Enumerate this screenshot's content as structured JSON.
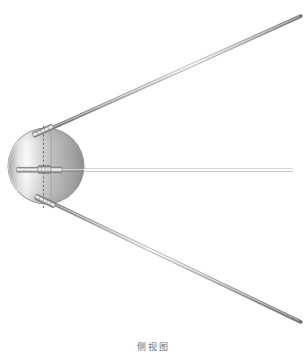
{
  "figure": {
    "caption": "侧视图",
    "caption_meaning": "side view",
    "background_color": "#ffffff",
    "canvas": {
      "width": 307,
      "height": 364
    },
    "body": {
      "name": "pressurized sphere",
      "shape": "circle",
      "center_x": 46,
      "center_y": 166,
      "radius_x": 38,
      "radius_y": 38,
      "outline_color": "#8a8a8a",
      "highlight_color": "#ffffff",
      "shadow_color": "#8d8d8d",
      "mid_tone_color": "#c9c9c9"
    },
    "centerline": {
      "name": "vertical dashed centerline",
      "style": "dashed",
      "color": "#6b6b6b",
      "x": 43,
      "y_top": 126,
      "y_bottom": 208
    },
    "seam_line": {
      "name": "hemisphere joint seam",
      "style": "solid",
      "color": "#9a9a9a",
      "x": 51,
      "y_top": 131,
      "y_bottom": 203
    },
    "antennas": [
      {
        "id": "antenna-upper",
        "label": "upper long antenna",
        "length_px": 265,
        "x1": 40,
        "y1": 133,
        "x2": 300,
        "y2": 16,
        "color": "#8f8f8f",
        "highlight": "#e8e8e8",
        "width_px": 3
      },
      {
        "id": "antenna-lower",
        "label": "lower long antenna",
        "length_px": 268,
        "x1": 42,
        "y1": 199,
        "x2": 300,
        "y2": 322,
        "color": "#8f8f8f",
        "highlight": "#e8e8e8",
        "width_px": 3
      },
      {
        "id": "antenna-horizontal",
        "label": "short horizontal antenna",
        "length_px": 275,
        "x1": 18,
        "y1": 170,
        "x2": 293,
        "y2": 170,
        "color": "#9b9b9b",
        "highlight": "#ededed",
        "width_px": 4
      }
    ],
    "fittings": [
      {
        "id": "fitting-upper",
        "label": "upper antenna mount",
        "cx": 43,
        "cy": 130
      },
      {
        "id": "fitting-lower",
        "label": "lower antenna mount",
        "cx": 45,
        "cy": 201
      },
      {
        "id": "fitting-center",
        "label": "horizontal antenna collar",
        "cx": 47,
        "cy": 170
      }
    ],
    "palette": {
      "line": "#8a8a8a",
      "dark": "#6b6b6b",
      "light": "#f2f2f2",
      "metal_mid": "#c0c0c0",
      "caption_text": "#6d6d6d"
    }
  }
}
